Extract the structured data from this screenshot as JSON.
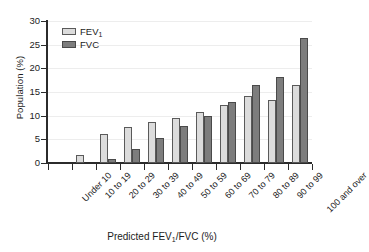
{
  "chart_data": {
    "type": "bar",
    "title": "",
    "xlabel": "Predicted FEV1/FVC (%)",
    "ylabel": "Population (%)",
    "ylim": [
      0,
      30
    ],
    "yticks": [
      0,
      5,
      10,
      15,
      20,
      25,
      30
    ],
    "grid": true,
    "legend_position": "top-left",
    "categories": [
      "Under 10",
      "10 to 19",
      "20 to 29",
      "30 to 39",
      "40 to 49",
      "50 to 59",
      "60 to 69",
      "70 to 79",
      "80 to 89",
      "90 to 99",
      "100 and over"
    ],
    "series": [
      {
        "name": "FEV1",
        "color": "#dcdcdc",
        "values": [
          0,
          1.7,
          6.2,
          7.6,
          8.7,
          9.5,
          10.7,
          12.2,
          14.1,
          13.3,
          16.5
        ]
      },
      {
        "name": "FVC",
        "color": "#7d7d7d",
        "values": [
          0,
          0,
          0.9,
          3.0,
          5.2,
          7.8,
          10.0,
          12.9,
          16.5,
          18.2,
          26.4
        ]
      }
    ]
  },
  "axes": {
    "ylabel_text": "Population (%)",
    "xlabel_prefix": "Predicted FEV",
    "xlabel_sub": "1",
    "xlabel_suffix": "/FVC (%)",
    "ytick_labels": [
      "30",
      "25",
      "20",
      "15",
      "10",
      "5",
      "0"
    ]
  },
  "legend": {
    "entries": [
      {
        "label_prefix": "FEV",
        "label_sub": "1",
        "label_suffix": "",
        "swatch": "legend-swatch-fev1"
      },
      {
        "label_prefix": "FVC",
        "label_sub": "",
        "label_suffix": "",
        "swatch": "legend-swatch-fvc"
      }
    ]
  }
}
